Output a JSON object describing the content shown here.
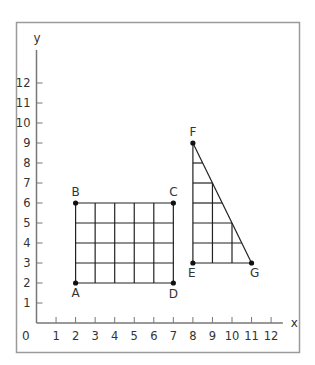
{
  "frame": {
    "stroke": "#9a9a9a"
  },
  "axes": {
    "x_label": "x",
    "y_label": "y",
    "origin_label": "0",
    "x_ticks": [
      "1",
      "2",
      "3",
      "4",
      "5",
      "6",
      "7",
      "8",
      "9",
      "10",
      "11",
      "12"
    ],
    "y_ticks": [
      "1",
      "2",
      "3",
      "4",
      "5",
      "6",
      "7",
      "8",
      "9",
      "10",
      "11",
      "12"
    ],
    "axis_color": "#777777"
  },
  "rectangle": {
    "vertices": [
      {
        "label": "A",
        "x": 2,
        "y": 2
      },
      {
        "label": "B",
        "x": 2,
        "y": 6
      },
      {
        "label": "C",
        "x": 7,
        "y": 6
      },
      {
        "label": "D",
        "x": 7,
        "y": 2
      }
    ]
  },
  "triangle": {
    "vertices": [
      {
        "label": "E",
        "x": 8,
        "y": 3
      },
      {
        "label": "F",
        "x": 8,
        "y": 9
      },
      {
        "label": "G",
        "x": 11,
        "y": 3
      }
    ]
  },
  "chart_data": {
    "type": "scatter",
    "title": "",
    "xlabel": "x",
    "ylabel": "y",
    "xlim": [
      0,
      12
    ],
    "ylim": [
      0,
      12
    ],
    "grid": false,
    "series": [
      {
        "name": "Rectangle ABCD",
        "points": [
          {
            "label": "A",
            "x": 2,
            "y": 2
          },
          {
            "label": "B",
            "x": 2,
            "y": 6
          },
          {
            "label": "C",
            "x": 7,
            "y": 6
          },
          {
            "label": "D",
            "x": 7,
            "y": 2
          }
        ]
      },
      {
        "name": "Triangle EFG",
        "points": [
          {
            "label": "E",
            "x": 8,
            "y": 3
          },
          {
            "label": "F",
            "x": 8,
            "y": 9
          },
          {
            "label": "G",
            "x": 11,
            "y": 3
          }
        ]
      }
    ]
  }
}
